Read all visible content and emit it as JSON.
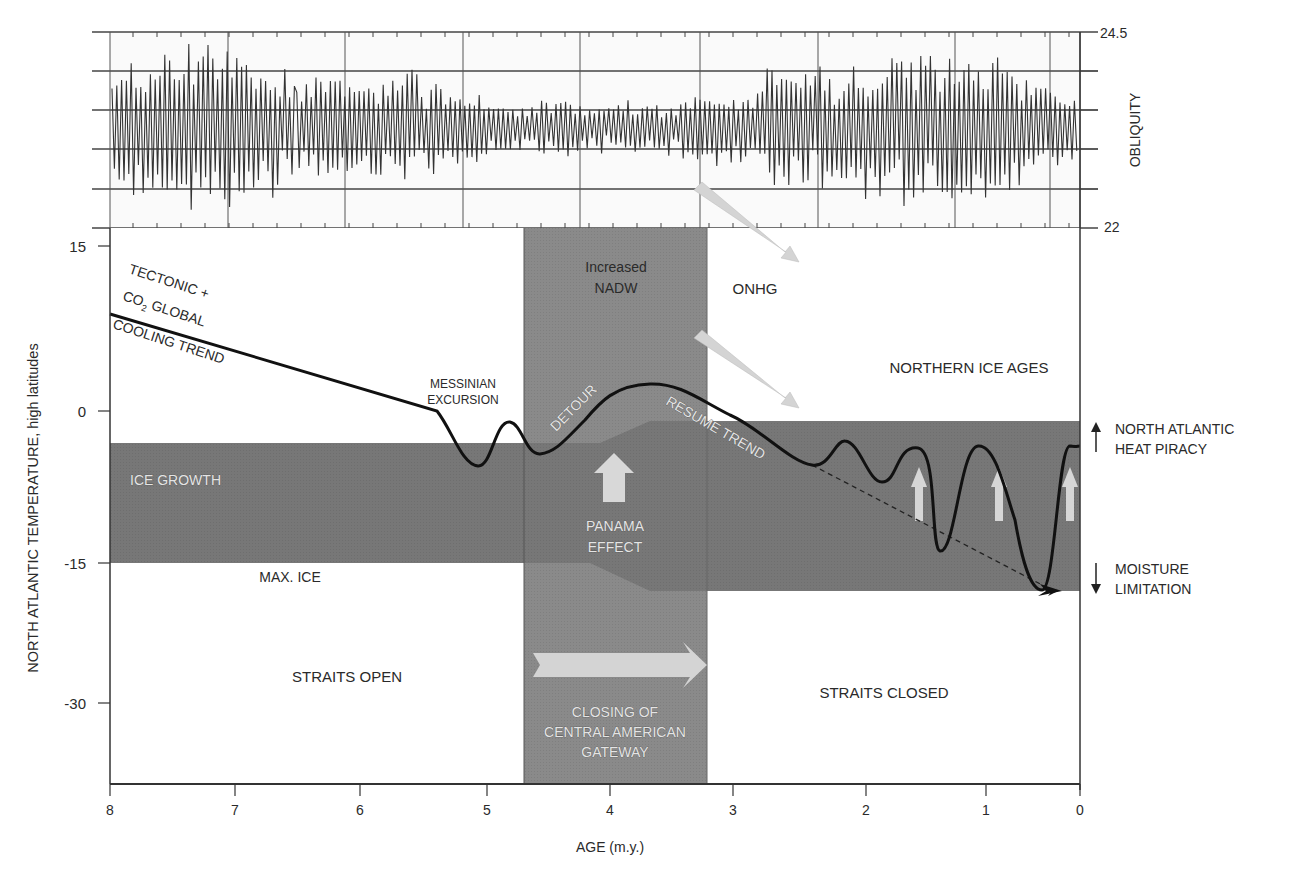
{
  "chart_data": [
    {
      "type": "line",
      "title": "Obliquity",
      "ylabel": "OBLIQUITY",
      "ylim": [
        22,
        24.5
      ],
      "yticks": [
        "24.5",
        "22"
      ],
      "xlim": [
        8,
        0
      ],
      "grid": true,
      "description": "High-frequency obliquity oscillation (~41 kyr cycle) between ~22.2 and ~24.4 degrees over the last 8 m.y.; amplitude envelope modulates, lower around 4.5-3 m.y."
    },
    {
      "type": "line",
      "title": "North Atlantic temperature trend, high latitudes",
      "xlabel": "AGE (m.y.)",
      "ylabel": "NORTH ATLANTIC TEMPERATURE, high latitudes",
      "xlim": [
        8,
        0
      ],
      "ylim": [
        -40,
        15
      ],
      "xticks": [
        "8",
        "7",
        "6",
        "5",
        "4",
        "3",
        "2",
        "1",
        "0"
      ],
      "yticks": [
        "15",
        "0",
        "-15",
        "-30"
      ],
      "series": [
        {
          "name": "Temperature trend",
          "x": [
            8,
            5.35,
            5.0,
            4.75,
            4.5,
            4.2,
            3.7,
            3.2,
            2.4,
            2.2,
            1.85,
            1.5,
            1.15,
            0.9,
            0.4,
            0.05
          ],
          "y": [
            9,
            0,
            -5,
            -1,
            -4,
            -2,
            2.5,
            -1,
            -5,
            -3,
            -9,
            -3,
            -14,
            -3,
            -17,
            -3
          ]
        },
        {
          "name": "Continued cooling trend (dashed)",
          "x": [
            2.4,
            0.25
          ],
          "y": [
            -5,
            -17
          ]
        }
      ],
      "bands": [
        {
          "name": "ICE GROWTH",
          "x": [
            8,
            0
          ],
          "y_top": -3,
          "y_bottom": -15
        },
        {
          "name": "Closing of Central American Gateway",
          "x": [
            4.7,
            3.2
          ],
          "y_top": 15,
          "y_bottom": -40
        }
      ],
      "annotations": [
        "TECTONIC +",
        "CO2 GLOBAL",
        "COOLING TREND",
        "MESSINIAN EXCURSION",
        "Increased NADW",
        "DETOUR",
        "ONHG",
        "RESUME TREND",
        "NORTHERN ICE AGES",
        "ICE GROWTH",
        "PANAMA EFFECT",
        "MAX. ICE",
        "STRAITS OPEN",
        "CLOSING OF CENTRAL AMERICAN GATEWAY",
        "STRAITS CLOSED",
        "NORTH ATLANTIC HEAT PIRACY",
        "MOISTURE LIMITATION"
      ]
    }
  ],
  "obliquity": {
    "axis_label": "OBLIQUITY",
    "tick_top": "24.5",
    "tick_bottom": "22"
  },
  "axes": {
    "x_label": "AGE (m.y.)",
    "x_ticks": [
      "8",
      "7",
      "6",
      "5",
      "4",
      "3",
      "2",
      "1",
      "0"
    ],
    "y_label": "NORTH ATLANTIC TEMPERATURE, high latitudes",
    "y_ticks": [
      "15",
      "0",
      "-15",
      "-30"
    ]
  },
  "labels": {
    "tectonic": "TECTONIC +",
    "co2_prefix": "CO",
    "co2_sub": "2",
    "co2_suffix": " GLOBAL",
    "cooling": "COOLING TREND",
    "messinian_1": "MESSINIAN",
    "messinian_2": "EXCURSION",
    "nadw_1": "Increased",
    "nadw_2": "NADW",
    "detour": "DETOUR",
    "onhg": "ONHG",
    "resume": "RESUME TREND",
    "northern_ice_ages": "NORTHERN ICE AGES",
    "ice_growth": "ICE GROWTH",
    "panama_1": "PANAMA",
    "panama_2": "EFFECT",
    "max_ice": "MAX. ICE",
    "straits_open": "STRAITS OPEN",
    "gateway_1": "CLOSING OF",
    "gateway_2": "CENTRAL AMERICAN",
    "gateway_3": "GATEWAY",
    "straits_closed": "STRAITS CLOSED",
    "heat_piracy_1": "NORTH ATLANTIC",
    "heat_piracy_2": "HEAT PIRACY",
    "moisture_1": "MOISTURE",
    "moisture_2": "LIMITATION"
  },
  "colors": {
    "ice_band": "#7a7a7a",
    "gateway_band": "#8c8c8c",
    "gateway_upper": "#858585",
    "arrow_light": "#d6d6d6",
    "line": "#111111",
    "axis": "#333333"
  }
}
